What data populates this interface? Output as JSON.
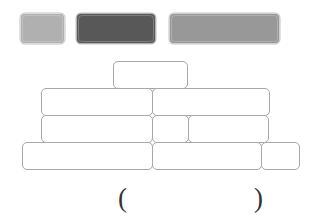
{
  "page": {
    "background_color": "#ffffff"
  },
  "swatches": {
    "label": "Color key bars",
    "items": [
      {
        "name": "light-gray-bar",
        "color": "#b0b0b0",
        "x": 20,
        "y": 13,
        "width": 45,
        "height": 31,
        "label": ""
      },
      {
        "name": "dark-gray-bar",
        "color": "#585858",
        "x": 76,
        "y": 13,
        "width": 80,
        "height": 31,
        "label": ""
      },
      {
        "name": "medium-gray-bar",
        "color": "#989898",
        "x": 169,
        "y": 13,
        "width": 111,
        "height": 31,
        "label": ""
      }
    ]
  },
  "bar_model": {
    "label": "Stacked bar model",
    "outline_color": "#a8a8a8",
    "fill_color": "#ffffff",
    "rows": [
      {
        "name": "row-1-top",
        "x": 113,
        "y": 61,
        "height": 28,
        "cells": [
          {
            "name": "cell-1-1",
            "width": 75,
            "label": ""
          }
        ]
      },
      {
        "name": "row-2",
        "x": 41,
        "y": 88,
        "height": 28,
        "cells": [
          {
            "name": "cell-2-1",
            "width": 112,
            "label": ""
          },
          {
            "name": "cell-2-2",
            "width": 118,
            "label": ""
          }
        ]
      },
      {
        "name": "row-3",
        "x": 41,
        "y": 115,
        "height": 28,
        "cells": [
          {
            "name": "cell-3-1",
            "width": 112,
            "label": ""
          },
          {
            "name": "cell-3-2",
            "width": 37,
            "label": ""
          },
          {
            "name": "cell-3-3",
            "width": 81,
            "label": ""
          }
        ]
      },
      {
        "name": "row-4-bottom",
        "x": 22,
        "y": 142,
        "height": 28,
        "cells": [
          {
            "name": "cell-4-1",
            "width": 131,
            "label": ""
          },
          {
            "name": "cell-4-2",
            "width": 110,
            "label": ""
          },
          {
            "name": "cell-4-3",
            "width": 39,
            "label": ""
          }
        ]
      }
    ]
  },
  "answer": {
    "name": "answer-parentheses",
    "open_paren": "(",
    "close_paren": ")",
    "value": "",
    "placeholder": ""
  }
}
